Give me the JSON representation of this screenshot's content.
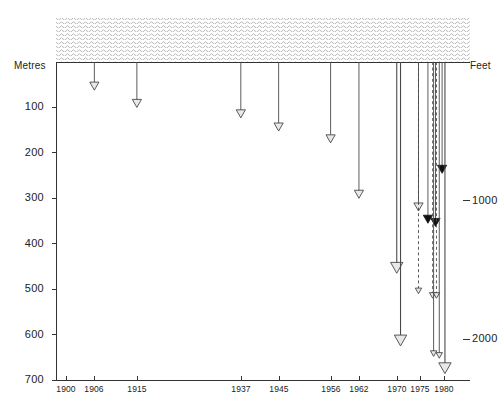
{
  "figure": {
    "left_axis_title": "Metres",
    "right_axis_title": "Feet",
    "surface_band_name": "water-surface-hatching"
  },
  "chart_data": {
    "type": "scatter",
    "title": "",
    "subtitle": "",
    "xlabel": "",
    "ylabel": "Metres",
    "y2label": "Feet",
    "grid": false,
    "legend": "none",
    "y_axis_inverted": true,
    "xlim": [
      1896,
      1984
    ],
    "ylim": [
      0,
      700
    ],
    "y2lim": [
      0,
      2296
    ],
    "x_tick_labels": [
      "1900",
      "1906",
      "1915",
      "1937",
      "1945",
      "1956",
      "1962",
      "1970",
      "1975",
      "1980"
    ],
    "x_ticks": [
      1900,
      1906,
      1915,
      1937,
      1945,
      1956,
      1962,
      1970,
      1975,
      1980
    ],
    "y_tick_labels": [
      "100",
      "200",
      "300",
      "400",
      "500",
      "600",
      "700"
    ],
    "y_ticks": [
      100,
      200,
      300,
      400,
      500,
      600,
      700
    ],
    "y2_tick_labels": [
      "1000",
      "2000"
    ],
    "y2_ticks": [
      1000,
      2000
    ],
    "annotations": [],
    "points": [
      {
        "x": 1906,
        "depth_m": 62,
        "marker": "open-arrow",
        "line": "solid",
        "size": "normal"
      },
      {
        "x": 1915,
        "depth_m": 100,
        "marker": "open-arrow",
        "line": "solid",
        "size": "normal"
      },
      {
        "x": 1937,
        "depth_m": 123,
        "marker": "open-arrow",
        "line": "solid",
        "size": "normal"
      },
      {
        "x": 1945,
        "depth_m": 152,
        "marker": "open-arrow",
        "line": "solid",
        "size": "normal"
      },
      {
        "x": 1956,
        "depth_m": 178,
        "marker": "open-arrow",
        "line": "solid",
        "size": "normal"
      },
      {
        "x": 1962,
        "depth_m": 300,
        "marker": "open-arrow",
        "line": "solid",
        "size": "normal"
      },
      {
        "x": 1970,
        "depth_m": 465,
        "marker": "open-arrow",
        "line": "solid",
        "size": "large"
      },
      {
        "x": 1974.6,
        "depth_m": 328,
        "marker": "open-arrow",
        "line": "solid",
        "size": "normal"
      },
      {
        "x": 1974.6,
        "depth_m": 510,
        "marker": "open-arrow",
        "line": "dashed",
        "size": "small"
      },
      {
        "x": 1970.8,
        "depth_m": 625,
        "marker": "open-arrow",
        "line": "solid",
        "size": "large"
      },
      {
        "x": 1976.6,
        "depth_m": 355,
        "marker": "solid-arrow",
        "line": "solid",
        "size": "normal"
      },
      {
        "x": 1978.2,
        "depth_m": 362,
        "marker": "solid-arrow",
        "line": "solid",
        "size": "normal"
      },
      {
        "x": 1979.6,
        "depth_m": 245,
        "marker": "solid-arrow",
        "line": "solid",
        "size": "normal"
      },
      {
        "x": 1977.6,
        "depth_m": 520,
        "marker": "open-arrow",
        "line": "dashed",
        "size": "small"
      },
      {
        "x": 1978.4,
        "depth_m": 520,
        "marker": "open-arrow",
        "line": "dashed",
        "size": "small"
      },
      {
        "x": 1977.8,
        "depth_m": 648,
        "marker": "open-arrow",
        "line": "solid",
        "size": "small"
      },
      {
        "x": 1979.0,
        "depth_m": 652,
        "marker": "open-arrow",
        "line": "solid",
        "size": "small"
      },
      {
        "x": 1980.2,
        "depth_m": 686,
        "marker": "open-arrow",
        "line": "solid",
        "size": "large"
      }
    ]
  },
  "colors": {
    "axis": "#333333",
    "line": "#4a4a4a",
    "marker_fill_open": "#e8e8e8",
    "marker_fill_solid": "#111111",
    "hatch": "#b8b8b8",
    "text": "#222222"
  }
}
